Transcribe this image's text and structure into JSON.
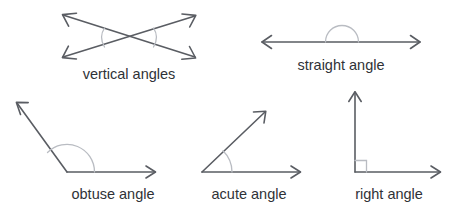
{
  "page": {
    "background_color": "#ffffff",
    "line_color": "#5a5d63",
    "arc_color": "#b9bcc2",
    "label_color": "#2f3237"
  },
  "figures": [
    {
      "id": "vertical-angles",
      "label": "vertical angles",
      "label_x": 129,
      "label_y": 79,
      "type": "two-crossing-lines",
      "description": "Two straight lines crossing in an X shape with double arrowheads on all four ends and light arcs marking the pair of opposite (vertical) angles",
      "arc_count": 2
    },
    {
      "id": "straight-angle",
      "label": "straight angle",
      "label_x": 341,
      "label_y": 70,
      "type": "straight-line",
      "description": "A horizontal line with arrowheads on both ends and a semicircular arc above the midpoint marking a 180 degree angle",
      "angle_degrees": 180,
      "arc_count": 1
    },
    {
      "id": "obtuse-angle",
      "label": "obtuse angle",
      "label_x": 113,
      "label_y": 199,
      "type": "angle",
      "description": "A ray pointing right and a ray pointing up-left from a shared vertex, with a large arc marking an angle greater than 90 degrees",
      "angle_degrees": 135,
      "arc_count": 1
    },
    {
      "id": "acute-angle",
      "label": "acute angle",
      "label_x": 249,
      "label_y": 199,
      "type": "angle",
      "description": "A ray pointing right and a ray pointing up-right from a shared vertex, with a small arc marking an angle less than 90 degrees",
      "angle_degrees": 45,
      "arc_count": 1
    },
    {
      "id": "right-angle",
      "label": "right angle",
      "label_x": 389,
      "label_y": 199,
      "type": "angle",
      "description": "A vertical ray pointing up and a horizontal ray pointing right from a shared vertex, with a small square marking a 90 degree angle",
      "angle_degrees": 90,
      "square_marker": true
    }
  ]
}
